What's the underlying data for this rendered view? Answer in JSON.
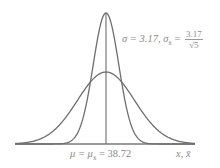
{
  "chart_data": {
    "type": "line",
    "title": "",
    "series": [
      {
        "name": "Population distribution of x",
        "mean": 38.72,
        "sd": 3.17,
        "shape": "wide normal curve"
      },
      {
        "name": "Sampling distribution of x-bar (n = 5)",
        "mean": 38.72,
        "sd": 1.4177,
        "shape": "narrow tall normal curve"
      }
    ],
    "xlabel": "x, x̄",
    "ylabel": "",
    "center_marker": {
      "label": "μ = μx̄ = 38.72",
      "value": 38.72
    },
    "annotation": "σ = 3.17, σx̄ = 3.17/√5",
    "grid": false,
    "legend": "none",
    "colors": {
      "curves": "#6e6e6e",
      "text": "#8a8a8a"
    }
  },
  "labels": {
    "sigma_prefix": "σ = 3.17, σ",
    "sigma_sub": "x̄",
    "sigma_eq": " = ",
    "frac_num": "3.17",
    "frac_den": "√5",
    "mu_text": "μ = μ",
    "mu_sub": "x̄",
    "mu_value": " = 38.72",
    "x_axis": "x, x̄"
  }
}
